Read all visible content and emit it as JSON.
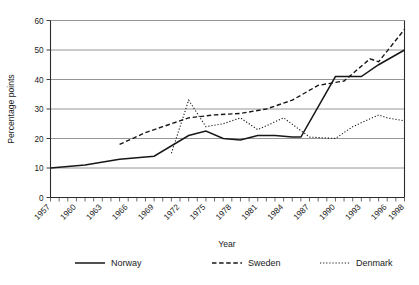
{
  "chart_data": {
    "type": "line",
    "title": "",
    "xlabel": "Year",
    "ylabel": "Percentage points",
    "xlim": [
      1957,
      1998
    ],
    "ylim": [
      0,
      60
    ],
    "grid": true,
    "legend_position": "bottom",
    "yticks": [
      0,
      10,
      20,
      30,
      40,
      50,
      60
    ],
    "ytick_labels": [
      "0",
      "10",
      "20",
      "30",
      "40",
      "50",
      "60"
    ],
    "xticks": [
      1957,
      1960,
      1963,
      1966,
      1969,
      1972,
      1975,
      1978,
      1981,
      1984,
      1987,
      1990,
      1993,
      1996,
      1998
    ],
    "xtick_labels": [
      "1957",
      "1960",
      "1963",
      "1966",
      "1969",
      "1972",
      "1975",
      "1978",
      "1981",
      "1984",
      "1987",
      "1990",
      "1993",
      "1996",
      "1998"
    ],
    "minor_xticks_every": 1,
    "series": [
      {
        "name": "Norway",
        "style": "solid",
        "color": "#171717",
        "x": [
          1957,
          1961,
          1965,
          1969,
          1973,
          1975,
          1977,
          1979,
          1981,
          1983,
          1985,
          1986,
          1990,
          1993,
          1995,
          1998
        ],
        "values": [
          10,
          11,
          13,
          14,
          21,
          22.5,
          20,
          19.5,
          21,
          21,
          20.5,
          20.5,
          41,
          41,
          45,
          50
        ]
      },
      {
        "name": "Sweden",
        "style": "dashed",
        "color": "#171717",
        "x": [
          1965,
          1968,
          1970,
          1973,
          1976,
          1979,
          1982,
          1985,
          1988,
          1991,
          1994,
          1995,
          1998
        ],
        "values": [
          18,
          22,
          24,
          27,
          28,
          28.5,
          30,
          33,
          38,
          39.5,
          47,
          46,
          57
        ]
      },
      {
        "name": "Denmark",
        "style": "dotted",
        "color": "#171717",
        "x": [
          1971,
          1973,
          1975,
          1977,
          1979,
          1981,
          1984,
          1987,
          1990,
          1992,
          1995,
          1996,
          1998
        ],
        "values": [
          15,
          33,
          24,
          25,
          27,
          23,
          27,
          20.5,
          20,
          24,
          28,
          27,
          26
        ]
      }
    ]
  },
  "legend": {
    "items": [
      {
        "label": "Norway"
      },
      {
        "label": "Sweden"
      },
      {
        "label": "Denmark"
      }
    ]
  },
  "axes": {
    "x_title": "Year",
    "y_title": "Percentage points"
  }
}
